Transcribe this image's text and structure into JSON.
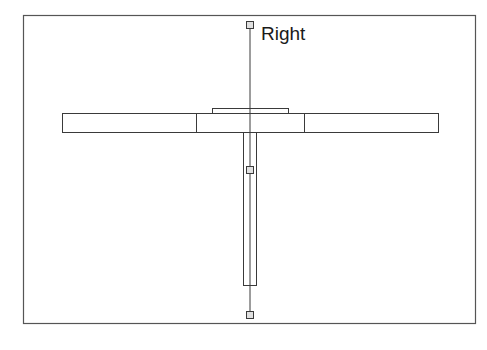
{
  "diagram": {
    "label": "Right",
    "colors": {
      "stroke": "#3a3a3a",
      "frame": "#555555",
      "handle_fill": "#e0e0e0"
    },
    "frame": {
      "x": 23,
      "y": 15,
      "w": 453,
      "h": 308
    },
    "horizontal_bar": {
      "x": 62,
      "y": 113,
      "w": 376,
      "h": 19,
      "dividers": [
        196,
        304
      ]
    },
    "top_cap": {
      "x": 212,
      "y": 108,
      "w": 76,
      "h": 5
    },
    "stem": {
      "x": 243,
      "y": 132,
      "w": 13,
      "h": 153
    },
    "axis_line": {
      "x": 250,
      "y1": 25,
      "y2": 315
    },
    "handles": [
      {
        "name": "top-handle",
        "cx": 250,
        "cy": 25
      },
      {
        "name": "middle-handle",
        "cx": 250,
        "cy": 170
      },
      {
        "name": "bottom-handle",
        "cx": 250,
        "cy": 315
      }
    ]
  }
}
